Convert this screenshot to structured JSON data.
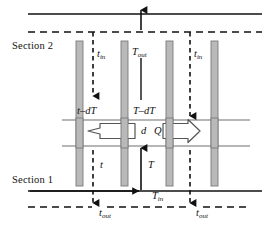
{
  "figure": {
    "kind": "engineering-schematic",
    "width": 269,
    "height": 228
  },
  "colors": {
    "line": "#111111",
    "thin_line": "#6f6f6f",
    "bar_fill": "#b9b9b9",
    "bar_stroke": "#7a7a7a",
    "block_arrow_stroke": "#555555",
    "block_arrow_fill": "#ffffff",
    "background": "#ffffff",
    "text": "#111111"
  },
  "labels": {
    "section_2": "Section 2",
    "section_1": "Section 1",
    "t_in_left": {
      "base": "t",
      "sub": "in"
    },
    "t_in_right": {
      "base": "t",
      "sub": "in"
    },
    "t_out_left": {
      "base": "t",
      "sub": "out"
    },
    "t_out_right": {
      "base": "t",
      "sub": "out"
    },
    "T_out": {
      "base": "T",
      "sub": "out"
    },
    "T_in": {
      "base": "T",
      "sub": "in"
    },
    "t_minus_dT": {
      "base": "t",
      "op": "–",
      "term": "dT"
    },
    "T_minus_dT": {
      "base": "T",
      "op": "–",
      "term": "dT"
    },
    "t_small": "t",
    "T_small": "T",
    "d": "d",
    "Q": "Q"
  },
  "geometry": {
    "top_solid_line_y": 14,
    "top_dashed_line_y": 32,
    "bottom_solid_line_y": 191,
    "bottom_dashed_line_y": 207,
    "mid_thin_line_1_y": 120,
    "mid_thin_line_2_y": 146,
    "bars_x": [
      76,
      121,
      166,
      211
    ],
    "bar_top_y": 41,
    "bar_bottom_y": 186,
    "bar_width": 7,
    "dashed_vertical_x": [
      93,
      190
    ],
    "solid_vertical_x": [
      141
    ],
    "diagram_left": 28,
    "diagram_right": 262
  },
  "elements": {
    "bar_count": 4,
    "dashed_arrow_count": 4,
    "solid_arrow_count": 3,
    "block_arrow_left_label": "Q-left",
    "block_arrow_right_label": "Q-right"
  }
}
